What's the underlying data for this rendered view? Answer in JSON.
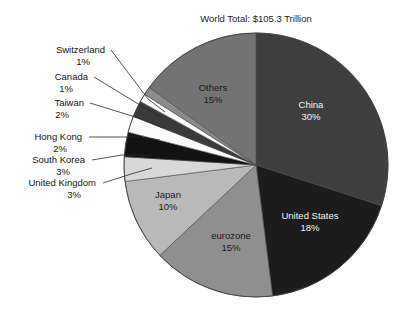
{
  "chart_data": {
    "type": "pie",
    "title": "World Total: $105.3 Trillion",
    "xlabel": "",
    "ylabel": "",
    "legend_position": "none",
    "grid": false,
    "total_label": "$105.3 Trillion",
    "units": "percent",
    "categories": [
      "China",
      "United States",
      "eurozone",
      "Japan",
      "United Kingdom",
      "South Korea",
      "Hong Kong",
      "Taiwan",
      "Canada",
      "Switzerland",
      "Others"
    ],
    "values": [
      30,
      18,
      15,
      10,
      3,
      3,
      2,
      2,
      1,
      1,
      15
    ],
    "slices": [
      {
        "name": "China",
        "label": "China",
        "value": 30,
        "percent_text": "30%",
        "color": "#3f3f3f",
        "label_placement": "inside",
        "label_color": "light",
        "label_x": 311,
        "label_y": 108
      },
      {
        "name": "United States",
        "label": "United States",
        "value": 18,
        "percent_text": "18%",
        "color": "#1c1c1c",
        "label_placement": "inside",
        "label_color": "light",
        "label_x": 310,
        "label_y": 219
      },
      {
        "name": "eurozone",
        "label": "eurozone",
        "value": 15,
        "percent_text": "15%",
        "color": "#8f8f8f",
        "label_placement": "inside",
        "label_color": "dark",
        "label_x": 231,
        "label_y": 239
      },
      {
        "name": "Japan",
        "label": "Japan",
        "value": 10,
        "percent_text": "10%",
        "color": "#b9b9b9",
        "label_placement": "inside",
        "label_color": "dark",
        "label_x": 168,
        "label_y": 198
      },
      {
        "name": "United Kingdom",
        "label": "United Kingdom",
        "value": 3,
        "percent_text": "3%",
        "color": "#d8d8d8",
        "label_placement": "callout",
        "label_color": "dark",
        "label_x": 96,
        "label_y": 186,
        "label_anchor": "end",
        "leader": "103,183 L 131,174 L 152,168"
      },
      {
        "name": "South Korea",
        "label": "South Korea",
        "value": 3,
        "percent_text": "3%",
        "color": "#121212",
        "label_placement": "callout",
        "label_color": "dark",
        "label_x": 85,
        "label_y": 163,
        "label_anchor": "end",
        "leader": "92,160 L 122,155 L 150,155"
      },
      {
        "name": "Hong Kong",
        "label": "Hong Kong",
        "value": 2,
        "percent_text": "2%",
        "color": "#fbfbfb",
        "label_placement": "callout",
        "label_color": "dark",
        "label_x": 82,
        "label_y": 140,
        "label_anchor": "end",
        "leader": "89,137 L 140,137 L 160,140"
      },
      {
        "name": "Taiwan",
        "label": "Taiwan",
        "value": 2,
        "percent_text": "2%",
        "color": "#3a3a3a",
        "label_placement": "callout",
        "label_color": "dark",
        "label_x": 84,
        "label_y": 106,
        "label_anchor": "end",
        "leader": "90,103 L 145,120 L 163,128"
      },
      {
        "name": "Canada",
        "label": "Canada",
        "value": 1,
        "percent_text": "1%",
        "color": "#fbfbfb",
        "label_placement": "callout",
        "label_color": "dark",
        "label_x": 88,
        "label_y": 80,
        "label_anchor": "end",
        "leader": "94,77 L 140,105 L 162,118"
      },
      {
        "name": "Switzerland",
        "label": "Switzerland",
        "value": 1,
        "percent_text": "1%",
        "color": "#8b8b8b",
        "label_placement": "callout",
        "label_color": "dark",
        "label_x": 105,
        "label_y": 53,
        "label_anchor": "end",
        "leader": "111,50 L 148,99 L 165,112"
      },
      {
        "name": "Others",
        "label": "Others",
        "value": 15,
        "percent_text": "15%",
        "color": "#737373",
        "label_placement": "inside",
        "label_color": "dark",
        "label_x": 213,
        "label_y": 91
      }
    ],
    "geometry": {
      "center_x": 256,
      "center_y": 165,
      "radius": 132,
      "start_angle_deg": -90,
      "direction": "clockwise"
    }
  }
}
